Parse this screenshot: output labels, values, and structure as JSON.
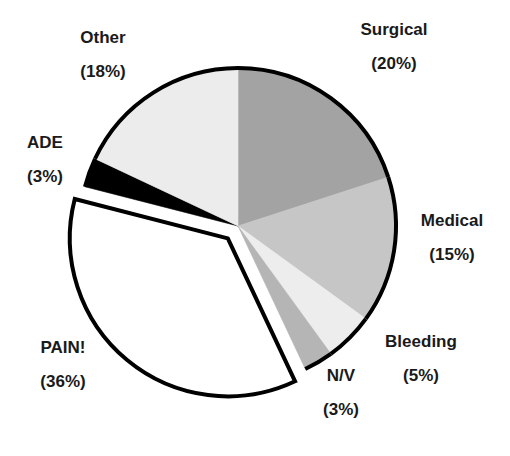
{
  "chart_data": {
    "type": "pie",
    "title": "",
    "start_angle_deg": 0,
    "direction": "clockwise",
    "slices": [
      {
        "label": "Surgical",
        "value": 20,
        "pct_label": "(20%)",
        "color": "#a3a3a3",
        "exploded": false
      },
      {
        "label": "Medical",
        "value": 15,
        "pct_label": "(15%)",
        "color": "#c6c6c6",
        "exploded": false
      },
      {
        "label": "Bleeding",
        "value": 5,
        "pct_label": "(5%)",
        "color": "#ededed",
        "exploded": false
      },
      {
        "label": "N/V",
        "value": 3,
        "pct_label": "(3%)",
        "color": "#b5b5b5",
        "exploded": false
      },
      {
        "label": "PAIN!",
        "value": 36,
        "pct_label": "(36%)",
        "color": "#ffffff",
        "exploded": true
      },
      {
        "label": "ADE",
        "value": 3,
        "pct_label": "(3%)",
        "color": "#000000",
        "exploded": false
      },
      {
        "label": "Other",
        "value": 18,
        "pct_label": "(18%)",
        "color": "#ececec",
        "exploded": false
      }
    ],
    "legend": "none (inline labels)"
  },
  "labels": {
    "surgical": {
      "name": "Surgical",
      "pct": "(20%)"
    },
    "medical": {
      "name": "Medical",
      "pct": "(15%)"
    },
    "bleeding": {
      "name": "Bleeding",
      "pct": "(5%)"
    },
    "nv": {
      "name": "N/V",
      "pct": "(3%)"
    },
    "pain": {
      "name": "PAIN!",
      "pct": "(36%)"
    },
    "ade": {
      "name": "ADE",
      "pct": "(3%)"
    },
    "other": {
      "name": "Other",
      "pct": "(18%)"
    }
  }
}
